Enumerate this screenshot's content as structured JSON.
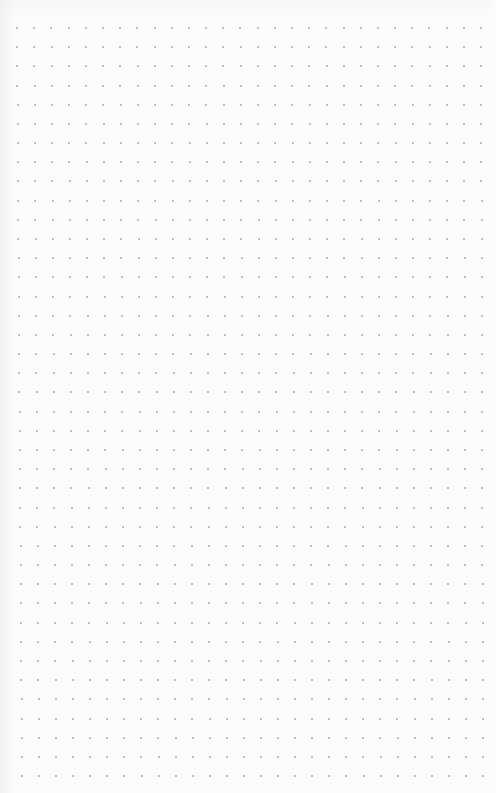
{
  "page": {
    "background_color": "#fbfbfb",
    "dot_color": "#9a9a9a"
  },
  "grid": {
    "columns": 28,
    "rows": 40,
    "top_row": {
      "y": 28,
      "x_start": 17,
      "x_end": 481
    },
    "bottom_row": {
      "y": 776,
      "x_start": 22,
      "x_end": 483
    },
    "dot_size": 2
  }
}
